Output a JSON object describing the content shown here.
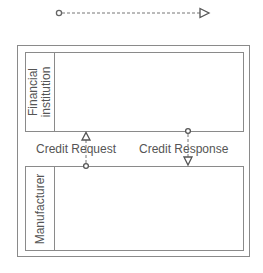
{
  "legend": {
    "description": "message flow",
    "line_style": "dashed",
    "start_marker": "circle",
    "end_marker": "open-triangle-arrow"
  },
  "pool": {
    "lanes": [
      {
        "label_line1": "Financial",
        "label_line2": "institution"
      },
      {
        "label_line1": "Manufacturer",
        "label_line2": ""
      }
    ]
  },
  "messages": [
    {
      "label": "Credit Request",
      "from": "Manufacturer",
      "to": "Financial institution"
    },
    {
      "label": "Credit Response",
      "from": "Financial institution",
      "to": "Manufacturer"
    }
  ],
  "colors": {
    "stroke": "#8a8a8a",
    "text": "#555555",
    "background": "#ffffff"
  }
}
